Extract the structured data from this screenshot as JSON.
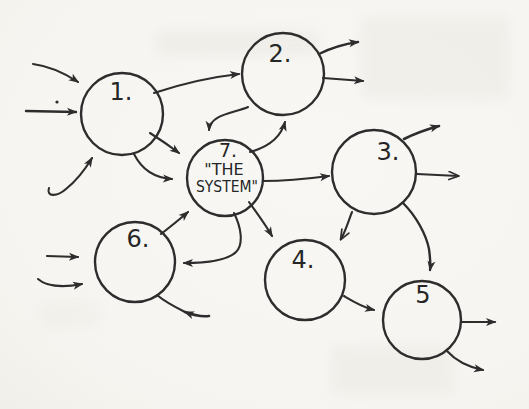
{
  "diagram": {
    "ink_color": "#2d2d2d",
    "paper_color": "#f6f5f1",
    "nodes": [
      {
        "name": "node-1",
        "cx": 122,
        "cy": 114,
        "r": 41,
        "lines": [
          {
            "text": "1.",
            "x": 121,
            "y": 100,
            "size": 24
          }
        ]
      },
      {
        "name": "node-2",
        "cx": 283,
        "cy": 74,
        "r": 41,
        "lines": [
          {
            "text": "2.",
            "x": 280,
            "y": 62,
            "size": 24
          }
        ]
      },
      {
        "name": "node-3",
        "cx": 374,
        "cy": 172,
        "r": 42,
        "lines": [
          {
            "text": "3.",
            "x": 388,
            "y": 160,
            "size": 24
          }
        ]
      },
      {
        "name": "node-4",
        "cx": 305,
        "cy": 280,
        "r": 40,
        "lines": [
          {
            "text": "4.",
            "x": 303,
            "y": 268,
            "size": 24
          }
        ]
      },
      {
        "name": "node-5",
        "cx": 422,
        "cy": 320,
        "r": 39,
        "lines": [
          {
            "text": "5",
            "x": 423,
            "y": 303,
            "size": 24
          }
        ]
      },
      {
        "name": "node-6",
        "cx": 135,
        "cy": 262,
        "r": 40,
        "lines": [
          {
            "text": "6.",
            "x": 138,
            "y": 247,
            "size": 24
          }
        ]
      },
      {
        "name": "node-7-the-system",
        "cx": 225,
        "cy": 178,
        "r": 38,
        "lines": [
          {
            "text": "7.",
            "x": 228,
            "y": 157,
            "size": 19
          },
          {
            "text": "\"THE",
            "x": 224,
            "y": 175,
            "size": 16
          },
          {
            "text": "SYSTEM\"",
            "x": 227,
            "y": 192,
            "size": 15,
            "tlen": 62
          }
        ]
      }
    ],
    "edges": [
      {
        "name": "into-1-top-left",
        "d": "M 33 64 C 48 66, 63 72, 78 82",
        "marker": "solid"
      },
      {
        "name": "into-1-left",
        "d": "M 26 111 L 76 112",
        "marker": "solid",
        "width": 2.4
      },
      {
        "name": "into-1-bottom-hook",
        "d": "M 49 188 C 46 197, 57 197, 66 189 C 76 181, 86 168, 92 158",
        "marker": "solid"
      },
      {
        "name": "1-to-2",
        "d": "M 154 93 C 184 83, 212 77, 239 74",
        "marker": "solid"
      },
      {
        "name": "1-to-7-upper",
        "d": "M 150 133 C 161 140, 171 147, 179 153",
        "marker": "solid"
      },
      {
        "name": "1-to-7-lower",
        "d": "M 134 154 C 142 170, 156 178, 172 179",
        "marker": "solid"
      },
      {
        "name": "2-to-7",
        "d": "M 248 107 C 235 113, 210 114, 209 130",
        "marker": "solid"
      },
      {
        "name": "7-to-2",
        "d": "M 250 152 C 268 147, 281 137, 285 122",
        "marker": "solid"
      },
      {
        "name": "7-to-3",
        "d": "M 263 181 C 283 181, 306 179, 329 176",
        "marker": "solid"
      },
      {
        "name": "7-to-4",
        "d": "M 249 202 C 256 212, 265 224, 272 236",
        "marker": "solid"
      },
      {
        "name": "3-to-4",
        "d": "M 352 212 C 348 222, 346 230, 341 239",
        "marker": "open"
      },
      {
        "name": "3-to-5",
        "d": "M 403 203 C 416 216, 426 234, 429 249 C 430 257, 431 264, 430 270",
        "marker": "solid",
        "width": 2.4
      },
      {
        "name": "4-to-5",
        "d": "M 344 296 C 354 302, 362 307, 374 310",
        "marker": "solid"
      },
      {
        "name": "6-to-7",
        "d": "M 161 234 C 170 227, 180 219, 188 212",
        "marker": "solid"
      },
      {
        "name": "7-to-6",
        "d": "M 234 213 C 241 227, 244 244, 236 252 C 227 261, 206 263, 184 263",
        "marker": "solid"
      },
      {
        "name": "2-out-upper",
        "d": "M 319 54 C 331 48, 344 44, 358 42",
        "marker": "solid",
        "width": 2.4
      },
      {
        "name": "2-out-lower",
        "d": "M 323 78 C 336 79, 350 80, 363 81",
        "marker": "solid"
      },
      {
        "name": "3-out-upper-right",
        "d": "M 404 139 C 416 133, 428 129, 439 126",
        "marker": "solid",
        "width": 2.6
      },
      {
        "name": "3-out-right",
        "d": "M 417 174 L 458 176",
        "marker": "open",
        "width": 1.8
      },
      {
        "name": "5-out-right",
        "d": "M 461 322 L 495 322",
        "marker": "solid"
      },
      {
        "name": "5-out-lower-right",
        "d": "M 447 351 C 456 361, 468 367, 483 370",
        "marker": "solid"
      },
      {
        "name": "into-6-upper-left",
        "d": "M 47 256 L 78 257",
        "marker": "solid"
      },
      {
        "name": "into-6-lower-left",
        "d": "M 38 279 C 46 286, 62 288, 82 284",
        "marker": "solid"
      },
      {
        "name": "into-6-bottom-tail",
        "d": "M 209 316 C 201 317, 193 315, 185 312",
        "marker": "solid",
        "width": 2.6
      },
      {
        "name": "into-6-bottom-line",
        "d": "M 185 312 C 173 306, 164 301, 157 295",
        "marker": "none"
      }
    ],
    "ink_dot": {
      "x": 57,
      "y": 102,
      "r": 1.6
    }
  }
}
